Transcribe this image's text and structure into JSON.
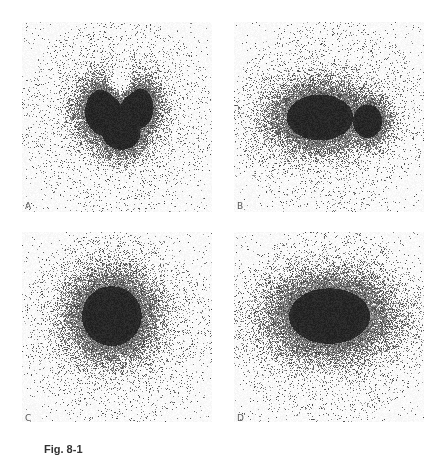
{
  "figure": {
    "background": "#ffffff",
    "ink_color": "#1e1e1e",
    "caption": "Fig. 8-1",
    "panels": [
      {
        "id": "A",
        "label": "A",
        "x": 22,
        "y": 22,
        "w": 190,
        "h": 190,
        "label_x": 3,
        "label_y": 179,
        "shape": "heart",
        "description": "Heart-shaped dense uptake in center"
      },
      {
        "id": "B",
        "label": "B",
        "x": 234,
        "y": 22,
        "w": 190,
        "h": 190,
        "label_x": 3,
        "label_y": 179,
        "shape": "ellipse-horizontal",
        "description": "Horizontally elongated dense uptake, slightly lobed on right"
      },
      {
        "id": "C",
        "label": "C",
        "x": 22,
        "y": 232,
        "w": 190,
        "h": 190,
        "label_x": 3,
        "label_y": 181,
        "shape": "round",
        "description": "Round dense uptake slightly left of center"
      },
      {
        "id": "D",
        "label": "D",
        "x": 234,
        "y": 232,
        "w": 190,
        "h": 190,
        "label_x": 3,
        "label_y": 181,
        "shape": "ellipse-wide",
        "description": "Wide oval dense uptake"
      }
    ]
  }
}
